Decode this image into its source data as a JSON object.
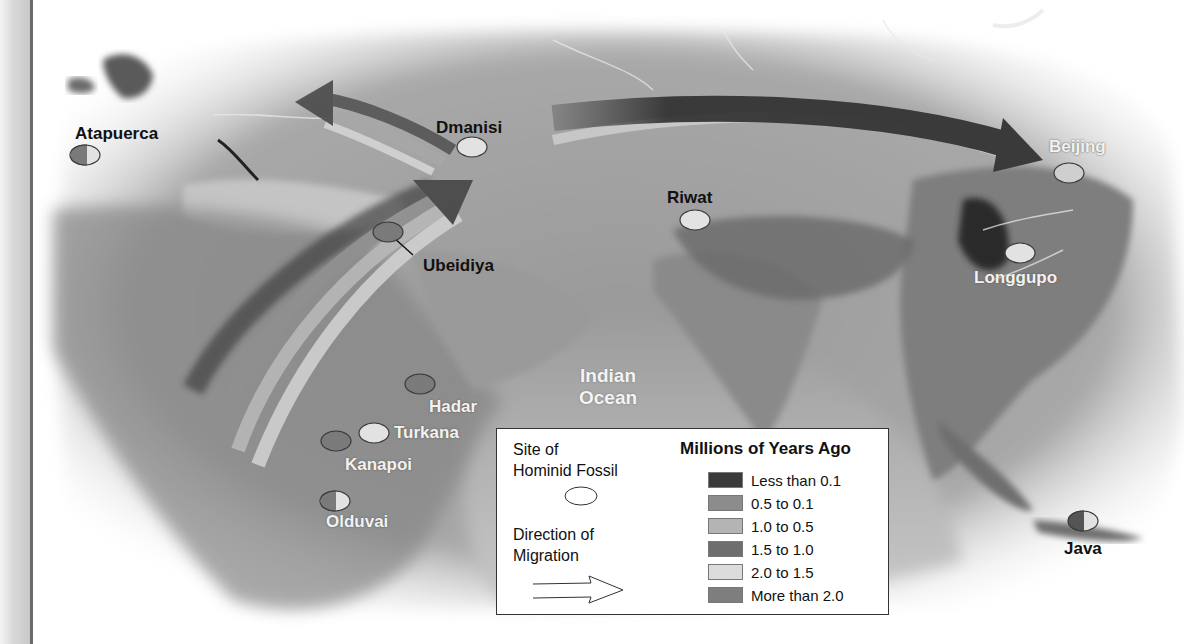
{
  "map": {
    "type": "hominid-migration-map",
    "ocean_labels": [
      {
        "id": "indian-ocean",
        "line1": "Indian",
        "line2": "Ocean"
      }
    ],
    "sites": [
      {
        "name": "Atapuerca",
        "style": "dark",
        "fill": "split"
      },
      {
        "name": "Dmanisi",
        "style": "dark",
        "fill": "#e2e2e2"
      },
      {
        "name": "Ubeidiya",
        "style": "dark",
        "fill": "#7a7a7a"
      },
      {
        "name": "Riwat",
        "style": "dark",
        "fill": "#e2e2e2"
      },
      {
        "name": "Beijing",
        "style": "light",
        "fill": "#cfcfcf"
      },
      {
        "name": "Longgupo",
        "style": "light",
        "fill": "#e2e2e2"
      },
      {
        "name": "Hadar",
        "style": "light",
        "fill": "#7a7a7a"
      },
      {
        "name": "Turkana",
        "style": "light",
        "fill": "#e2e2e2"
      },
      {
        "name": "Kanapoi",
        "style": "light",
        "fill": "#7a7a7a"
      },
      {
        "name": "Olduvai",
        "style": "light",
        "fill": "split"
      },
      {
        "name": "Java",
        "style": "dark",
        "fill": "split"
      }
    ]
  },
  "legend": {
    "site_label_line1": "Site of",
    "site_label_line2": "Hominid Fossil",
    "direction_label_line1": "Direction of",
    "direction_label_line2": "Migration",
    "heading": "Millions of Years Ago",
    "ranges": [
      {
        "label": "Less than 0.1",
        "color": "#3a3a3a"
      },
      {
        "label": "0.5 to 0.1",
        "color": "#8c8c8c"
      },
      {
        "label": "1.0 to 0.5",
        "color": "#b4b4b4"
      },
      {
        "label": "1.5 to 1.0",
        "color": "#6e6e6e"
      },
      {
        "label": "2.0 to 1.5",
        "color": "#dcdcdc"
      },
      {
        "label": "More than 2.0",
        "color": "#7e7e7e"
      }
    ]
  }
}
